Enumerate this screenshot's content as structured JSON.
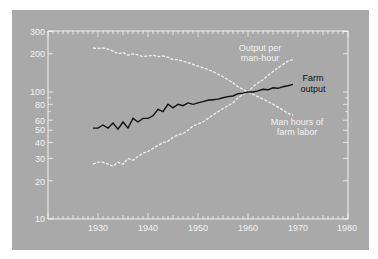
{
  "chart_data": {
    "type": "line",
    "title": "",
    "xlabel": "",
    "ylabel": "",
    "y_scale": "log",
    "xlim": [
      1920,
      1980
    ],
    "ylim": [
      10,
      300
    ],
    "grid": false,
    "x_ticks": [
      1930,
      1940,
      1950,
      1960,
      1970,
      1980
    ],
    "y_ticks": [
      10,
      20,
      30,
      40,
      50,
      60,
      80,
      100,
      200,
      300
    ],
    "x": [
      1929,
      1930,
      1931,
      1932,
      1933,
      1934,
      1935,
      1936,
      1937,
      1938,
      1939,
      1940,
      1941,
      1942,
      1943,
      1944,
      1945,
      1946,
      1947,
      1948,
      1949,
      1950,
      1951,
      1952,
      1953,
      1954,
      1955,
      1956,
      1957,
      1958,
      1959,
      1960,
      1961,
      1962,
      1963,
      1964,
      1965,
      1966,
      1967,
      1968,
      1969
    ],
    "series": [
      {
        "name": "Farm output",
        "color": "#111111",
        "style": "solid",
        "label_lines": [
          "Farm",
          "output"
        ],
        "values": [
          52,
          52,
          55,
          52,
          57,
          51,
          58,
          52,
          62,
          58,
          62,
          62,
          65,
          73,
          70,
          80,
          75,
          80,
          78,
          82,
          80,
          82,
          84,
          86,
          87,
          88,
          90,
          92,
          93,
          97,
          98,
          100,
          100,
          102,
          105,
          104,
          108,
          107,
          110,
          112,
          115
        ]
      },
      {
        "name": "Output per man-hour",
        "color": "#f0f0f0",
        "style": "dashed",
        "label_lines": [
          "Output per",
          "man-hour"
        ],
        "values": [
          27,
          28,
          28,
          27,
          26,
          28,
          27,
          30,
          29,
          31,
          33,
          34,
          36,
          38,
          40,
          41,
          44,
          46,
          47,
          50,
          54,
          56,
          58,
          62,
          66,
          70,
          74,
          78,
          82,
          90,
          96,
          100,
          110,
          118,
          125,
          135,
          145,
          155,
          165,
          175,
          180
        ]
      },
      {
        "name": "Man hours of farm labor",
        "color": "#f0f0f0",
        "style": "dashed",
        "label_lines": [
          "Man hours of",
          "farm labor"
        ],
        "values": [
          222,
          220,
          222,
          218,
          210,
          200,
          205,
          195,
          200,
          196,
          190,
          192,
          195,
          190,
          192,
          188,
          180,
          180,
          175,
          170,
          165,
          160,
          155,
          150,
          145,
          138,
          132,
          125,
          118,
          110,
          105,
          100,
          96,
          92,
          88,
          84,
          80,
          76,
          72,
          68,
          66
        ]
      }
    ]
  },
  "axes": {
    "x_tick_labels": [
      "1930",
      "1940",
      "1950",
      "1960",
      "1970",
      "1980"
    ],
    "y_tick_labels": [
      "300",
      "200",
      "100",
      "80",
      "60",
      "50",
      "40",
      "30",
      "20",
      "10"
    ]
  },
  "annotations": {
    "output_per_man_hour_line1": "Output per",
    "output_per_man_hour_line2": "man-hour",
    "farm_output_line1": "Farm",
    "farm_output_line2": "output",
    "man_hours_line1": "Man hours of",
    "man_hours_line2": "farm labor"
  },
  "colors": {
    "panel": "#a9a9a9",
    "axis": "#f2f2f2",
    "farm_output": "#111111",
    "light_series": "#f0f0f0"
  }
}
